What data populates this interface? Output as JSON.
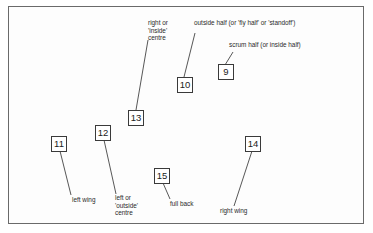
{
  "diagram": {
    "type": "rugby back-line positions",
    "positions": [
      {
        "number": "9",
        "label": "scrum half (or inside half)"
      },
      {
        "number": "10",
        "label": "outside half (or 'fly half' or 'standoff')"
      },
      {
        "number": "13",
        "label_lines": [
          "right or",
          "'inside'",
          "centre"
        ]
      },
      {
        "number": "12",
        "label_lines": [
          "left or",
          "'outside'",
          "centre"
        ]
      },
      {
        "number": "11",
        "label": "left wing"
      },
      {
        "number": "14",
        "label": "right wing"
      },
      {
        "number": "15",
        "label": "full back"
      }
    ]
  }
}
